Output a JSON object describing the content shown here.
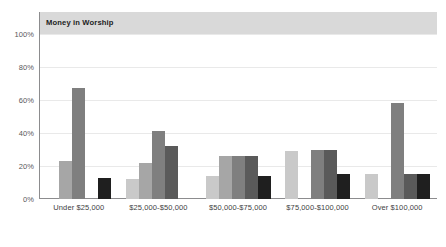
{
  "chart_data": {
    "type": "bar",
    "title": "Money in Worship",
    "xlabel": "",
    "ylabel": "",
    "ylim": [
      0,
      100
    ],
    "yticks": [
      "0%",
      "20%",
      "40%",
      "60%",
      "80%",
      "100%"
    ],
    "ytick_values": [
      0,
      20,
      40,
      60,
      80,
      100
    ],
    "grid": true,
    "legend": "none",
    "categories": [
      "Under $25,000",
      "$25,000-$50,000",
      "$50,000-$75,000",
      "$75,000-$100,000",
      "Over $100,000"
    ],
    "series": [
      {
        "name": "series-1",
        "color": "#c9c9c9",
        "values": [
          0,
          12,
          14,
          29,
          15
        ]
      },
      {
        "name": "series-2",
        "color": "#a6a6a6",
        "values": [
          23,
          22,
          26,
          0,
          0
        ]
      },
      {
        "name": "series-3",
        "color": "#7f7f7f",
        "values": [
          67,
          41,
          26,
          30,
          58
        ]
      },
      {
        "name": "series-4",
        "color": "#5a5a5a",
        "values": [
          0,
          32,
          26,
          30,
          15
        ]
      },
      {
        "name": "series-5",
        "color": "#1f1f1f",
        "values": [
          13,
          0,
          14,
          15,
          15
        ]
      }
    ]
  },
  "style": {
    "title_band_color": "#d9d9d9",
    "axis_color": "#8c8c8e",
    "gridline_color": "#e9e9e9",
    "tick_text_color": "#58585a",
    "label_text_color": "#414142",
    "background": "#ffffff"
  }
}
